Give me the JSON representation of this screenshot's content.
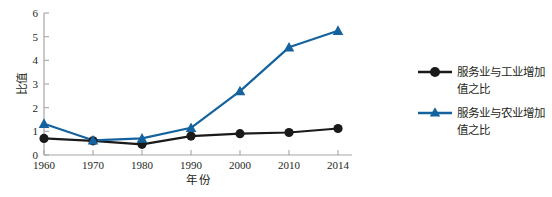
{
  "chart_data": {
    "type": "line",
    "title": "",
    "subtitle": "",
    "xlabel": "年 份",
    "ylabel": "比值",
    "categories": [
      "1960",
      "1970",
      "1980",
      "1990",
      "2000",
      "2010",
      "2014"
    ],
    "x_tick_labels": [
      "1960",
      "1970",
      "1980",
      "1990",
      "2000",
      "2010",
      "2014"
    ],
    "y_tick_labels": [
      "0",
      "1",
      "2",
      "3",
      "4",
      "5",
      "6"
    ],
    "ylim": [
      0,
      6
    ],
    "y_tick_step": 1,
    "grid": false,
    "legend_position": "right",
    "series": [
      {
        "name": "服务业与工业增加值之比",
        "name_line1": "服务业与工业增加",
        "name_line2": "值之比",
        "color": "#1a1a1a",
        "marker": "circle",
        "values": [
          0.7,
          0.6,
          0.45,
          0.8,
          0.9,
          0.95,
          1.12
        ]
      },
      {
        "name": "服务业与农业增加值之比",
        "name_line1": "服务业与农业增加",
        "name_line2": "值之比",
        "color": "#15639e",
        "marker": "triangle",
        "values": [
          1.32,
          0.62,
          0.7,
          1.15,
          2.7,
          4.55,
          5.25
        ]
      }
    ]
  },
  "axis": {
    "axis_color": "#a6a6a6",
    "tick_color": "#a6a6a6"
  }
}
